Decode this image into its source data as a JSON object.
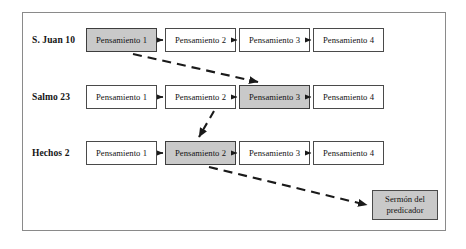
{
  "diagram": {
    "title_text": "",
    "frame": {
      "name": "diagram-border"
    },
    "colors": {
      "highlight_fill": "#c9c9c9",
      "box_fill": "#ffffff",
      "border": "#4a4a4a",
      "frame_border": "#8a8a8a",
      "arrow": "#1a1a1a",
      "text": "#121212"
    },
    "rows": [
      {
        "label": "S. Juan 10",
        "nodes": [
          {
            "text": "Pensamiento 1",
            "highlighted": true
          },
          {
            "text": "Pensamiento 2",
            "highlighted": false
          },
          {
            "text": "Pensamiento 3",
            "highlighted": false
          },
          {
            "text": "Pensamiento 4",
            "highlighted": false
          }
        ]
      },
      {
        "label": "Salmo 23",
        "nodes": [
          {
            "text": "Pensamiento 1",
            "highlighted": false
          },
          {
            "text": "Pensamiento 2",
            "highlighted": false
          },
          {
            "text": "Pensamiento 3",
            "highlighted": true
          },
          {
            "text": "Pensamiento 4",
            "highlighted": false
          }
        ]
      },
      {
        "label": "Hechos 2",
        "nodes": [
          {
            "text": "Pensamiento 1",
            "highlighted": false
          },
          {
            "text": "Pensamiento 2",
            "highlighted": true
          },
          {
            "text": "Pensamiento 3",
            "highlighted": false
          },
          {
            "text": "Pensamiento 4",
            "highlighted": false
          }
        ]
      }
    ],
    "terminal": {
      "line1": "Sermón del",
      "line2": "predicador"
    },
    "connections": {
      "solid_label": "secuencia",
      "dashed_label": "selección"
    }
  }
}
